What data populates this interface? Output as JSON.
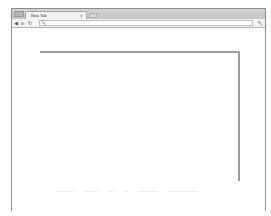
{
  "browser": {
    "tabs": [
      {
        "title": "New Tab",
        "close_glyph": "×",
        "active": true
      }
    ],
    "new_tab_button": "new-tab",
    "toolbar": {
      "back_icon": "◀",
      "forward_icon": "▶",
      "reload_icon": "↻",
      "omnibox_icon": "🔍",
      "omnibox_value": "",
      "menu_icon": "🔧"
    }
  },
  "page": {
    "content_box": {
      "border_color": "#9e9e9e"
    }
  },
  "colors": {
    "frame_border": "#8f8f8f",
    "tabstrip_bg": "#c8c8c8",
    "toolbar_bg": "#f3f3f3"
  }
}
